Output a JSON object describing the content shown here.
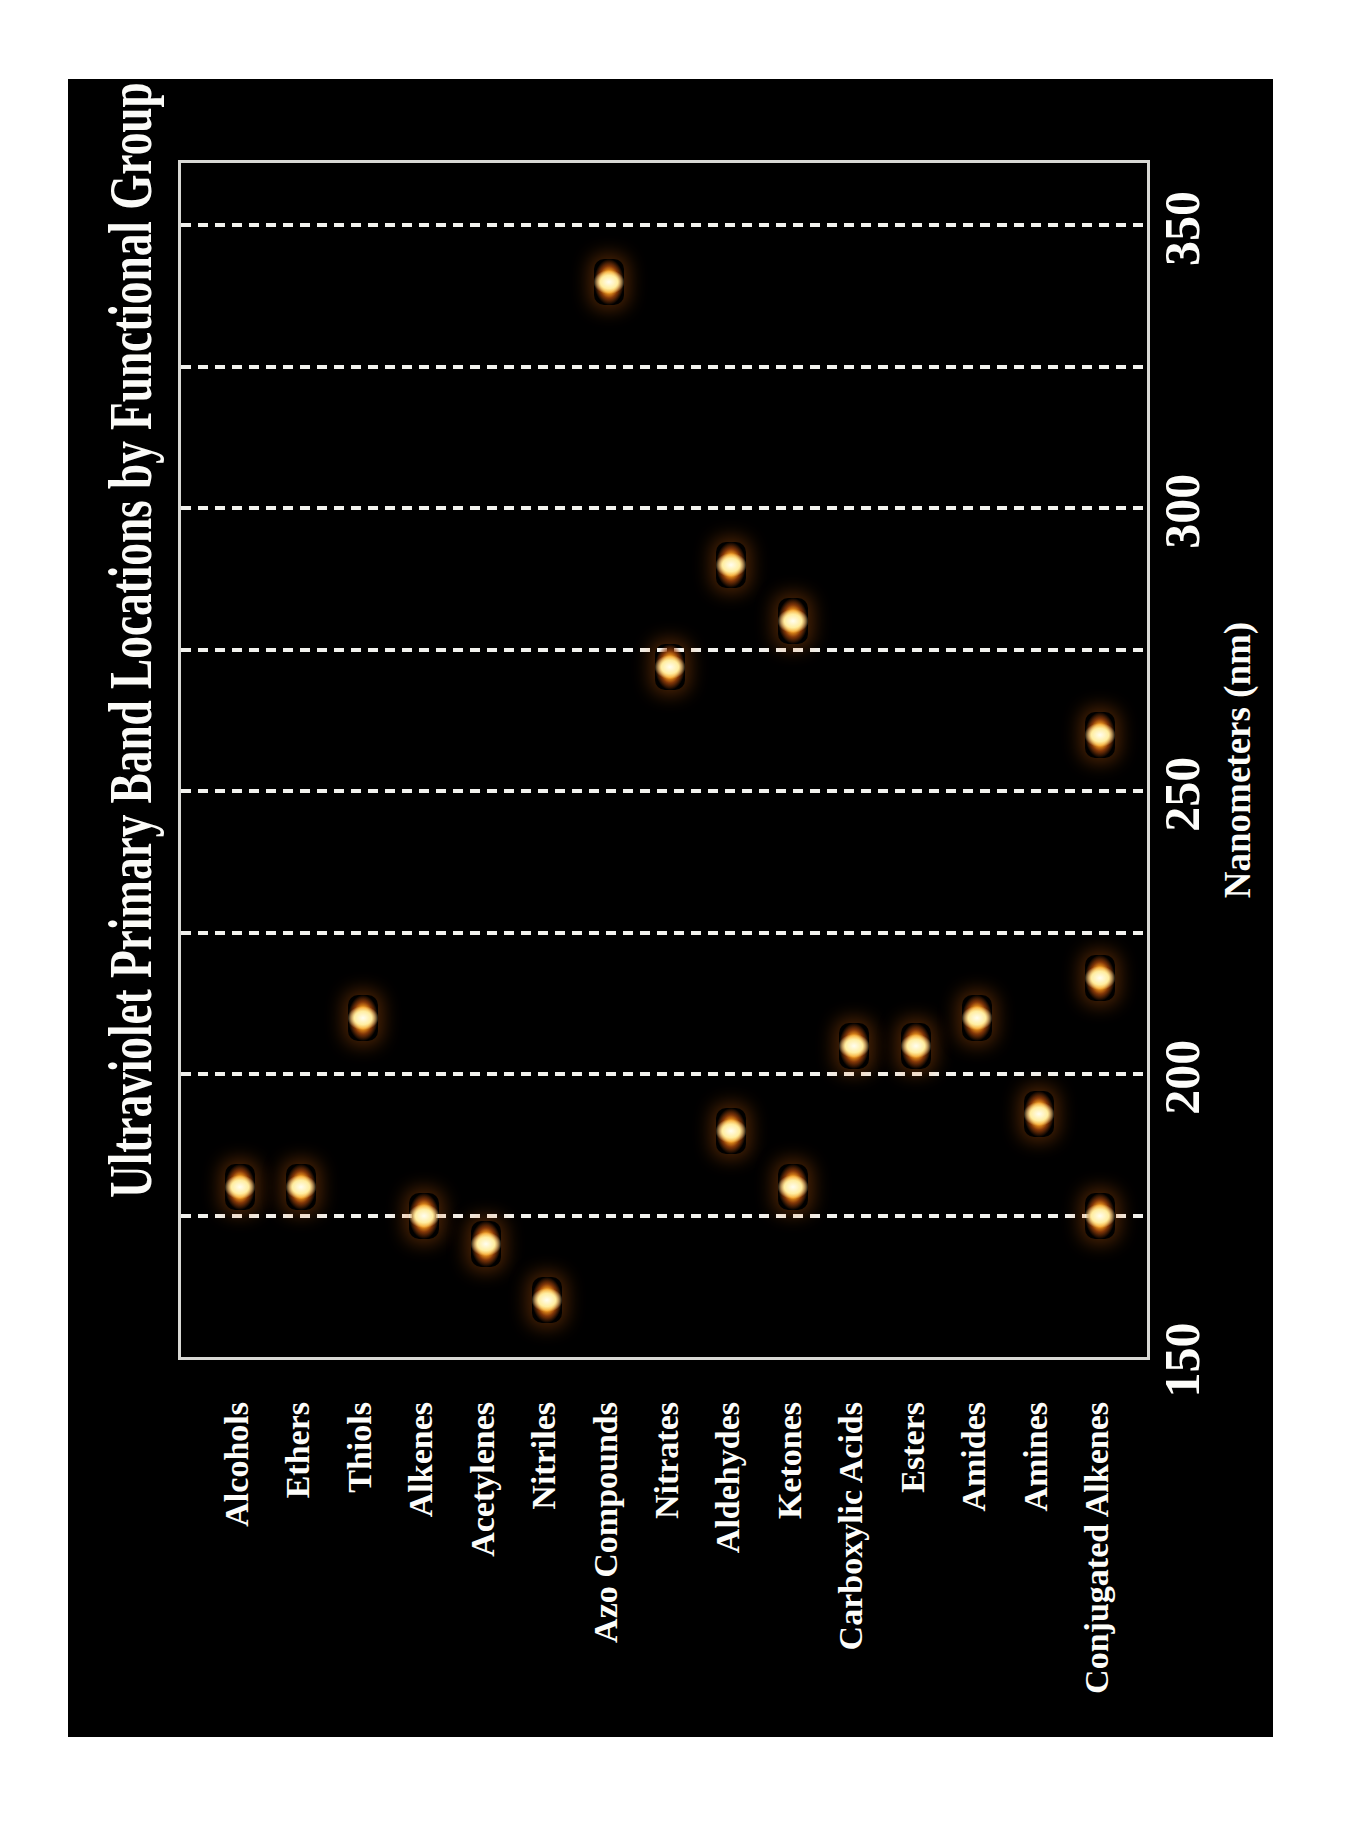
{
  "chart_data": {
    "type": "scatter",
    "title": "Ultraviolet Primary Band Locations by Functional Group",
    "xlabel": "Nanometers (nm)",
    "xlim": [
      150,
      362
    ],
    "xticks": [
      150,
      200,
      250,
      300,
      350
    ],
    "gridlines_nm": [
      175,
      200,
      225,
      250,
      275,
      300,
      325,
      350
    ],
    "grid_style": "dashed",
    "legend": "none",
    "orientation": "landscape chart printed rotated 90 degrees counter-clockwise on portrait page",
    "colors": {
      "page_background": "#ffffff",
      "chart_background": "#000000",
      "text": "#fdfdfa",
      "grid": "#f2f2ee",
      "plot_border": "#d8d8d4",
      "marker_core": "#fffdf0",
      "marker_body": "#f59c1e",
      "marker_edge": "#8a3a0c"
    },
    "groups": [
      {
        "label": "Alcohols",
        "bands_nm": [
          180
        ]
      },
      {
        "label": "Ethers",
        "bands_nm": [
          180
        ]
      },
      {
        "label": "Thiols",
        "bands_nm": [
          210
        ]
      },
      {
        "label": "Alkenes",
        "bands_nm": [
          175
        ]
      },
      {
        "label": "Acetylenes",
        "bands_nm": [
          170
        ]
      },
      {
        "label": "Nitriles",
        "bands_nm": [
          160
        ]
      },
      {
        "label": "Azo Compounds",
        "bands_nm": [
          340
        ]
      },
      {
        "label": "Nitrates",
        "bands_nm": [
          272
        ]
      },
      {
        "label": "Aldehydes",
        "bands_nm": [
          190,
          290
        ]
      },
      {
        "label": "Ketones",
        "bands_nm": [
          180,
          280
        ]
      },
      {
        "label": "Carboxylic Acids",
        "bands_nm": [
          205
        ]
      },
      {
        "label": "Esters",
        "bands_nm": [
          205
        ]
      },
      {
        "label": "Amides",
        "bands_nm": [
          210
        ]
      },
      {
        "label": "Amines",
        "bands_nm": [
          193
        ]
      },
      {
        "label": "Conjugated Alkenes",
        "bands_nm": [
          175,
          217,
          260
        ]
      }
    ]
  }
}
